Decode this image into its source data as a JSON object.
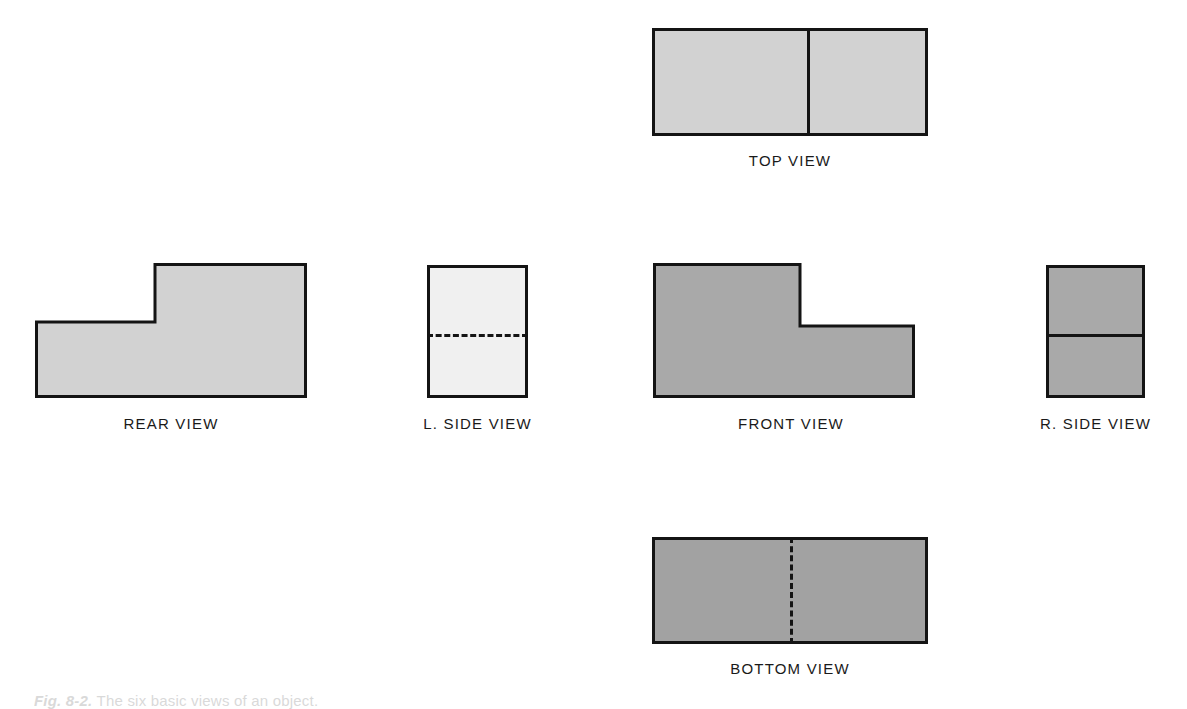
{
  "figure": {
    "caption_id": "Fig. 8-2.",
    "caption_text": "The six basic views of an object."
  },
  "palette": {
    "outline": "#141414",
    "fill_light": "#d2d2d2",
    "fill_lightest": "#f0f0f0",
    "fill_medium": "#a9a9a9",
    "fill_medium_dark": "#a2a2a2",
    "background": "#ffffff"
  },
  "views": {
    "top": {
      "label": "TOP VIEW",
      "shape": "rectangle",
      "fill": "#d2d2d2",
      "divider": "vertical",
      "divider_style": "solid",
      "divider_position_pct": 56
    },
    "rear": {
      "label": "REAR VIEW",
      "shape": "l-shape-step-right",
      "fill": "#d2d2d2",
      "step_width_pct": 44,
      "step_height_pct": 45
    },
    "left_side": {
      "label": "L. SIDE VIEW",
      "shape": "rectangle",
      "fill": "#f0f0f0",
      "divider": "horizontal",
      "divider_style": "dashed",
      "divider_position_pct": 52
    },
    "front": {
      "label": "FRONT VIEW",
      "shape": "l-shape-step-left",
      "fill": "#a9a9a9",
      "step_width_pct": 56,
      "step_height_pct": 45
    },
    "right_side": {
      "label": "R. SIDE VIEW",
      "shape": "rectangle",
      "fill": "#a9a9a9",
      "divider": "horizontal",
      "divider_style": "solid",
      "divider_position_pct": 52
    },
    "bottom": {
      "label": "BOTTOM VIEW",
      "shape": "rectangle",
      "fill": "#a2a2a2",
      "divider": "vertical",
      "divider_style": "dashed",
      "divider_position_pct": 50
    }
  }
}
